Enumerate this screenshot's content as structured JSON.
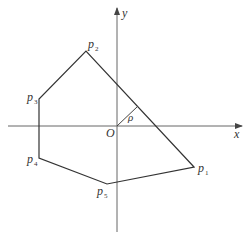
{
  "diagram": {
    "type": "polygon-in-coordinate-plane",
    "colors": {
      "stroke": "#333333",
      "axis": "#555555",
      "background": "#ffffff"
    },
    "axes": {
      "x_label": "x",
      "y_label": "y",
      "origin_label": "O"
    },
    "perpendicular": {
      "label": "ρ"
    },
    "vertices": [
      {
        "id": "p1",
        "name": "p",
        "sub": "1"
      },
      {
        "id": "p2",
        "name": "p",
        "sub": "2"
      },
      {
        "id": "p3",
        "name": "p",
        "sub": "3"
      },
      {
        "id": "p4",
        "name": "p",
        "sub": "4"
      },
      {
        "id": "p5",
        "name": "p",
        "sub": "5"
      }
    ]
  }
}
